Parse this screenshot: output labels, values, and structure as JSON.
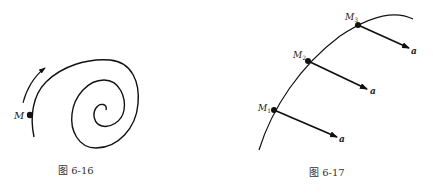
{
  "figures": [
    {
      "id": "fig-6-16",
      "caption": "图 6-16",
      "point_label": "M",
      "description": "Spiral trajectory with point M and direction-of-motion arrow"
    },
    {
      "id": "fig-6-17",
      "caption": "图 6-17",
      "points": [
        {
          "label": "M",
          "sub": "1",
          "vector_label": "a"
        },
        {
          "label": "M",
          "sub": "2",
          "vector_label": "a"
        },
        {
          "label": "M",
          "sub": "3",
          "vector_label": "a"
        }
      ],
      "description": "Curved trajectory with three points M1, M2, M3 each with parallel equal acceleration vectors a"
    }
  ],
  "colors": {
    "stroke": "#111111",
    "background": "#ffffff"
  }
}
